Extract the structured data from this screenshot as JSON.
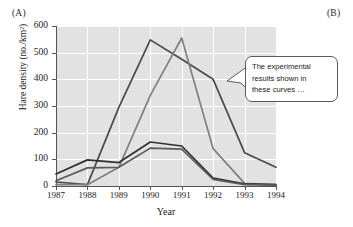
{
  "figure": {
    "panel_a_label": "(A)",
    "panel_b_label": "(B)"
  },
  "callout": {
    "line1": "The experimental",
    "line2": "results shown in",
    "line3": "these curves …",
    "text": "The experimental results shown in these curves …",
    "border_color": "#5a5a5a",
    "background_color": "#ffffff"
  },
  "axes": {
    "x_title": "Year",
    "y_title": "Hare density (no./km²)",
    "x_ticks": [
      "1987",
      "1988",
      "1989",
      "1990",
      "1991",
      "1992",
      "1993",
      "1994"
    ],
    "y_ticks": [
      "0",
      "100",
      "200",
      "300",
      "400",
      "500",
      "600"
    ],
    "plot_background": "#e2e2e2",
    "gridline_color": "#ffffff",
    "axis_color": "#555555"
  },
  "chart_data": {
    "type": "line",
    "title": "",
    "subtitle": "",
    "xlabel": "Year",
    "ylabel": "Hare density (no./km²)",
    "xlim": [
      1987,
      1994
    ],
    "ylim": [
      0,
      600
    ],
    "x": [
      1987,
      1988,
      1989,
      1990,
      1991,
      1992,
      1993,
      1994
    ],
    "xticks": [
      1987,
      1988,
      1989,
      1990,
      1991,
      1992,
      1993,
      1994
    ],
    "yticks": [
      0,
      100,
      200,
      300,
      400,
      500,
      600
    ],
    "grid": true,
    "legend": "none",
    "annotations": [
      {
        "text": "The experimental results shown in these curves …",
        "type": "callout",
        "points_to_x": 1992,
        "points_to_y": 400
      }
    ],
    "series": [
      {
        "name": "food-addition treatment",
        "color": "#4a4a4a",
        "values": [
          15,
          5,
          295,
          548,
          475,
          400,
          125,
          70
        ]
      },
      {
        "name": "predator-exclusion treatment",
        "color": "#808080",
        "values": [
          5,
          5,
          70,
          340,
          555,
          140,
          10,
          5
        ]
      },
      {
        "name": "control (unmanipulated) A",
        "color": "#303030",
        "values": [
          45,
          98,
          88,
          165,
          150,
          30,
          8,
          5
        ]
      },
      {
        "name": "control (unmanipulated) B",
        "color": "#5a5a5a",
        "values": [
          20,
          68,
          70,
          142,
          138,
          25,
          5,
          3
        ]
      }
    ]
  }
}
